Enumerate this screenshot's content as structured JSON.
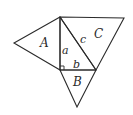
{
  "diagram": {
    "title": "",
    "colors": {
      "stroke": "#2a2a2a",
      "background": "#ffffff"
    },
    "shapes": [
      {
        "id": "triangle-A",
        "label": "A",
        "points": [
          [
            60,
            17
          ],
          [
            14,
            43
          ],
          [
            60,
            70
          ]
        ]
      },
      {
        "id": "triangle-C",
        "label": "C",
        "points": [
          [
            60,
            17
          ],
          [
            124,
            18
          ],
          [
            96,
            70
          ]
        ]
      },
      {
        "id": "triangle-B",
        "label": "B",
        "points": [
          [
            60,
            70
          ],
          [
            96,
            70
          ],
          [
            77,
            107
          ]
        ]
      },
      {
        "id": "right-triangle",
        "points": [
          [
            60,
            17
          ],
          [
            60,
            70
          ],
          [
            96,
            70
          ]
        ]
      }
    ],
    "labels": {
      "A": "A",
      "B": "B",
      "C": "C",
      "a": "a",
      "b": "b",
      "c": "c"
    },
    "annotations": {
      "right_angle_marker": "right angle at vertex between sides a and b"
    }
  }
}
